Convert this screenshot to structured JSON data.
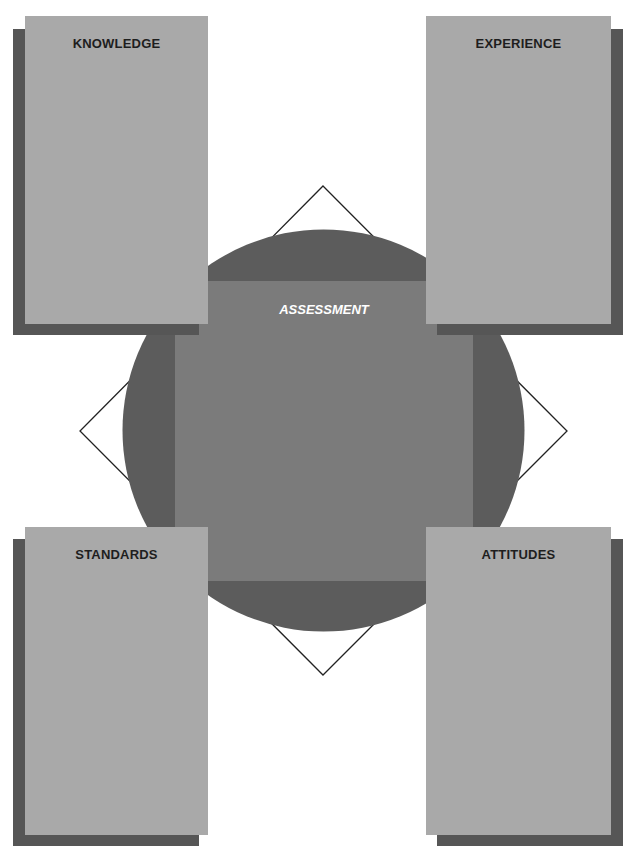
{
  "diagram": {
    "center": {
      "label": "ASSESSMENT"
    },
    "cards": [
      {
        "id": "top-left",
        "label": "KNOWLEDGE"
      },
      {
        "id": "top-right",
        "label": "EXPERIENCE"
      },
      {
        "id": "bottom-left",
        "label": "STANDARDS"
      },
      {
        "id": "bottom-right",
        "label": "ATTITUDES"
      }
    ],
    "colors": {
      "card": "#a9a9a9",
      "shadow": "#565656",
      "circle": "#5c5c5c",
      "center_rect": "#7b7b7b",
      "diamond_stroke": "#222222",
      "center_text": "#ffffff",
      "card_text": "#1e1e1e"
    }
  }
}
